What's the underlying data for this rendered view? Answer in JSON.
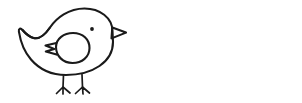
{
  "canvas": {
    "width": 302,
    "height": 103,
    "background_color": "#ffffff",
    "ink_color": "#1a1a1a",
    "stroke_width": 2.1,
    "style": "black-and-white line art, uncolored coloring-book outline"
  },
  "artwork": {
    "title": "Two Birds",
    "subject": "bird",
    "count": 2,
    "arrangement": "side-by-side horizontal pair, mirrored"
  },
  "birds": [
    {
      "id": "bird-left",
      "label": "Left bird",
      "facing": "right",
      "mirrored": false,
      "bounds": {
        "x": 18,
        "y": 8,
        "width": 108,
        "height": 87
      },
      "eye": {
        "cx": 92,
        "cy": 29,
        "r": 1.9,
        "fill": "#1a1a1a"
      },
      "parts": [
        "body",
        "tail",
        "beak",
        "eye",
        "wing",
        "leg-front",
        "leg-back",
        "foot-front",
        "foot-back"
      ],
      "beak": {
        "shape": "hollow-triangle",
        "points_toward": "right"
      },
      "wing": {
        "shape": "teardrop",
        "feather_notches": 2,
        "notch_side": "left"
      },
      "tail": {
        "shape": "pointed-swept",
        "side": "left"
      },
      "legs": 2,
      "toes_per_foot": 3
    },
    {
      "id": "bird-right",
      "label": "Right bird",
      "facing": "left",
      "mirrored": true,
      "bounds": {
        "x": 176,
        "y": 8,
        "width": 109,
        "height": 87
      },
      "eye": {
        "cx": 210,
        "cy": 29,
        "r": 1.9,
        "fill": "#1a1a1a"
      },
      "parts": [
        "body",
        "tail",
        "beak",
        "eye",
        "wing",
        "leg-front",
        "leg-back",
        "foot-front",
        "foot-back"
      ],
      "beak": {
        "shape": "hollow-triangle",
        "points_toward": "left"
      },
      "wing": {
        "shape": "teardrop",
        "feather_notches": 2,
        "notch_side": "right"
      },
      "tail": {
        "shape": "pointed-swept",
        "side": "right"
      },
      "legs": 2,
      "toes_per_foot": 3
    }
  ],
  "geometry": {
    "body_path": "M 112.5 31.5 C 112.5 17.5 99.5 8.5 84.5 8.5 C 68.5 8.5 56.5 18.0 50.0 27.5 C 44.5 35.5 39.0 39.5 33.5 38.0 C 29.0 36.8 25.5 33.5 22.5 30.0 C 20.5 27.7 18.4 28.6 18.9 31.6 C 20.6 42.2 24.5 52.0 31.0 59.5 C 39.0 68.8 51.0 75.0 66.0 75.0 C 92.5 75.0 113.0 62.0 113.0 42.0 Z",
    "tail_path": "M 22.5 30.0 C 25.5 33.5 29.0 36.8 33.5 38.0 C 39.0 39.5 44.5 35.5 50.0 27.5",
    "beak_path": "M 112.3 27.6 L 126.0 32.6 L 111.5 38.4 Z",
    "wing_path": "M 56.0 47.0 C 56.0 38.5 64.0 33.0 73.0 33.0 C 83.0 33.0 89.5 39.5 89.5 48.0 C 89.5 57.0 82.0 63.0 72.5 63.0 C 63.0 63.0 56.0 56.0 56.0 47.0 Z",
    "wing_notch_path": "M 56.4 43.0 L 45.5 45.6 L 54.3 48.9 L 45.8 51.4 L 56.6 54.6",
    "leg_front_path": "M 82.0 74.5 L 82.5 87.0",
    "leg_back_path": "M 63.5 75.0 L 63.0 87.0",
    "foot_front_path": "M 75.5 93.5 L 82.5 87.0 L 89.5 93.0 M 82.5 87.0 L 83.0 94.0",
    "foot_back_path": "M 56.5 93.5 L 63.0 87.0 L 70.0 93.0 M 63.0 87.0 L 63.0 94.0"
  }
}
